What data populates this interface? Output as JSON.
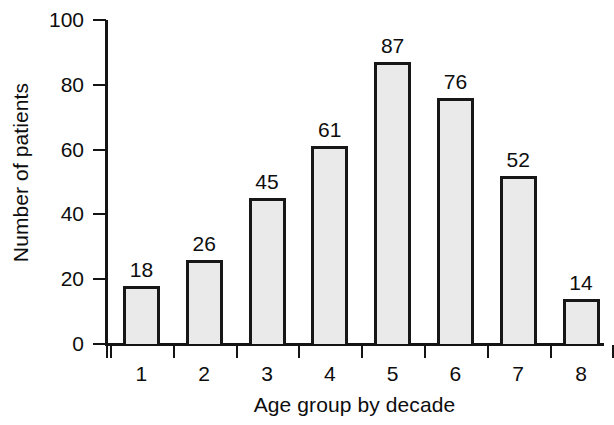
{
  "chart_data": {
    "type": "bar",
    "title": "",
    "subtitle": "",
    "xlabel": "Age group by decade",
    "ylabel": "Number of patients",
    "categories": [
      "1",
      "2",
      "3",
      "4",
      "5",
      "6",
      "7",
      "8"
    ],
    "values": [
      18,
      26,
      45,
      61,
      87,
      76,
      52,
      14
    ],
    "data_labels": [
      "18",
      "26",
      "45",
      "61",
      "87",
      "76",
      "52",
      "14"
    ],
    "ylim": [
      0,
      100
    ],
    "yticks": [
      0,
      20,
      40,
      60,
      80,
      100
    ],
    "ytick_labels": [
      "0",
      "20",
      "40",
      "60",
      "80",
      "100"
    ],
    "grid": false,
    "legend": null,
    "legend_position": "none",
    "bar_fill_color": "#ebeaea",
    "bar_edge_color": "#171717",
    "axis_color": "#141414",
    "text_color": "#0d0d0d",
    "background_color": "#ffffff",
    "xtick_style": "between-bars",
    "annotations": []
  }
}
